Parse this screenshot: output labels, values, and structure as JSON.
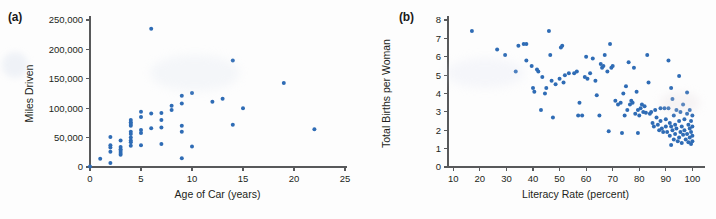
{
  "figure": {
    "background_color": "#fdfdfd",
    "marker_color": "#2f6cb5",
    "axis_color": "#58595b",
    "text_color": "#231f20"
  },
  "panels": [
    {
      "key": "a",
      "label": "(a)",
      "chart_data": {
        "type": "scatter",
        "title": "",
        "xlabel": "Age of Car (years)",
        "ylabel": "Miles Driven",
        "xlim": [
          0,
          25
        ],
        "ylim": [
          0,
          250000
        ],
        "xticks": [
          0,
          5,
          10,
          15,
          20,
          25
        ],
        "xticklabels": [
          "0",
          "5",
          "10",
          "15",
          "20",
          "25"
        ],
        "yticks": [
          0,
          50000,
          100000,
          150000,
          200000,
          250000
        ],
        "yticklabels": [
          "0",
          "50,000",
          "100,000",
          "150,000",
          "200,000",
          "250,000"
        ],
        "grid": false,
        "legend": "none",
        "series": [
          {
            "name": "Cars",
            "points": [
              [
                0,
                1000
              ],
              [
                1,
                14000
              ],
              [
                2,
                7000
              ],
              [
                2,
                26000
              ],
              [
                2,
                33000
              ],
              [
                2,
                37000
              ],
              [
                2,
                51000
              ],
              [
                3,
                21000
              ],
              [
                3,
                24000
              ],
              [
                3,
                27000
              ],
              [
                3,
                30000
              ],
              [
                3,
                34000
              ],
              [
                3,
                45000
              ],
              [
                4,
                36000
              ],
              [
                4,
                42000
              ],
              [
                4,
                45000
              ],
              [
                4,
                50000
              ],
              [
                4,
                56000
              ],
              [
                4,
                60000
              ],
              [
                4,
                70000
              ],
              [
                4,
                73000
              ],
              [
                4,
                76000
              ],
              [
                4,
                80000
              ],
              [
                5,
                37000
              ],
              [
                5,
                58000
              ],
              [
                5,
                63000
              ],
              [
                5,
                85000
              ],
              [
                5,
                94000
              ],
              [
                6,
                235000
              ],
              [
                6,
                66000
              ],
              [
                6,
                91000
              ],
              [
                7,
                39000
              ],
              [
                7,
                67000
              ],
              [
                7,
                80000
              ],
              [
                7,
                92000
              ],
              [
                8,
                97000
              ],
              [
                8,
                104000
              ],
              [
                9,
                15000
              ],
              [
                9,
                60000
              ],
              [
                9,
                70000
              ],
              [
                9,
                108000
              ],
              [
                9,
                121000
              ],
              [
                10,
                35000
              ],
              [
                10,
                126000
              ],
              [
                12,
                111000
              ],
              [
                13,
                116000
              ],
              [
                14,
                72000
              ],
              [
                14,
                181000
              ],
              [
                15,
                100000
              ],
              [
                19,
                143000
              ],
              [
                22,
                64000
              ]
            ]
          }
        ]
      }
    },
    {
      "key": "b",
      "label": "(b)",
      "chart_data": {
        "type": "scatter",
        "title": "",
        "xlabel": "Literacy Rate (percent)",
        "ylabel": "Total Births per Woman",
        "xlim": [
          8,
          104
        ],
        "ylim": [
          0,
          8
        ],
        "xticks": [
          10,
          20,
          30,
          40,
          50,
          60,
          70,
          80,
          90,
          100
        ],
        "xticklabels": [
          "10",
          "20",
          "30",
          "40",
          "50",
          "60",
          "70",
          "80",
          "90",
          "100"
        ],
        "yticks": [
          0,
          1,
          2,
          3,
          4,
          5,
          6,
          7,
          8
        ],
        "yticklabels": [
          "0",
          "1",
          "2",
          "3",
          "4",
          "5",
          "6",
          "7",
          "8"
        ],
        "grid": false,
        "legend": "none",
        "series": [
          {
            "name": "Countries",
            "points": [
              [
                17,
                7.4
              ],
              [
                26.5,
                6.4
              ],
              [
                29.5,
                6.1
              ],
              [
                33.5,
                5.2
              ],
              [
                34.5,
                6.6
              ],
              [
                36.5,
                6.7
              ],
              [
                37.5,
                6.7
              ],
              [
                37.5,
                5.8
              ],
              [
                39.5,
                5.5
              ],
              [
                40,
                4.3
              ],
              [
                40.5,
                4.1
              ],
              [
                41.5,
                5.3
              ],
              [
                42,
                5.2
              ],
              [
                43,
                3.1
              ],
              [
                43.5,
                4.9
              ],
              [
                44.5,
                4.0
              ],
              [
                45,
                4.3
              ],
              [
                46,
                7.4
              ],
              [
                46.5,
                6.1
              ],
              [
                47,
                4.7
              ],
              [
                47.5,
                2.7
              ],
              [
                48.5,
                4.5
              ],
              [
                50,
                4.8
              ],
              [
                50.5,
                6.5
              ],
              [
                51,
                6.6
              ],
              [
                51.5,
                4.6
              ],
              [
                52,
                5.0
              ],
              [
                53.5,
                5.1
              ],
              [
                55.5,
                5.1
              ],
              [
                56.5,
                5.2
              ],
              [
                57,
                2.8
              ],
              [
                57.5,
                3.5
              ],
              [
                58.5,
                2.8
              ],
              [
                59.5,
                4.9
              ],
              [
                60,
                6.0
              ],
              [
                60.5,
                4.8
              ],
              [
                61.5,
                5.1
              ],
              [
                62.5,
                5.9
              ],
              [
                63.5,
                4.7
              ],
              [
                64,
                3.9
              ],
              [
                65,
                2.8
              ],
              [
                65.5,
                5.6
              ],
              [
                66,
                5.4
              ],
              [
                66.5,
                5.5
              ],
              [
                67,
                6.1
              ],
              [
                68,
                5.2
              ],
              [
                68.5,
                1.95
              ],
              [
                69,
                6.7
              ],
              [
                69.5,
                5.4
              ],
              [
                70,
                5.5
              ],
              [
                71,
                3.6
              ],
              [
                72,
                3.4
              ],
              [
                73,
                3.5
              ],
              [
                73.5,
                1.85
              ],
              [
                74,
                4.0
              ],
              [
                74.5,
                2.8
              ],
              [
                75,
                4.4
              ],
              [
                75.5,
                3.1
              ],
              [
                76,
                5.7
              ],
              [
                76.5,
                3.4
              ],
              [
                77,
                3.6
              ],
              [
                77.5,
                3.5
              ],
              [
                78,
                5.4
              ],
              [
                78.5,
                2.9
              ],
              [
                79,
                4.1
              ],
              [
                79.5,
                3.1
              ],
              [
                79.5,
                1.85
              ],
              [
                80,
                2.8
              ],
              [
                80.5,
                3.2
              ],
              [
                81,
                3.4
              ],
              [
                81.5,
                3.0
              ],
              [
                82,
                3.3
              ],
              [
                82.5,
                2.95
              ],
              [
                83,
                6.1
              ],
              [
                83.5,
                4.6
              ],
              [
                84,
                2.9
              ],
              [
                84.5,
                3.0
              ],
              [
                85,
                2.4
              ],
              [
                85.5,
                2.2
              ],
              [
                86,
                3.1
              ],
              [
                86.5,
                2.7
              ],
              [
                87,
                2.3
              ],
              [
                87.5,
                2.0
              ],
              [
                88,
                3.2
              ],
              [
                88,
                2.5
              ],
              [
                88.5,
                2.1
              ],
              [
                89,
                1.9
              ],
              [
                89.5,
                3.2
              ],
              [
                90,
                2.6
              ],
              [
                90,
                2.2
              ],
              [
                90.5,
                1.9
              ],
              [
                91,
                5.8
              ],
              [
                91,
                3.2
              ],
              [
                91.5,
                2.4
              ],
              [
                91.5,
                1.7
              ],
              [
                92,
                4.3
              ],
              [
                92,
                2.2
              ],
              [
                92,
                1.2
              ],
              [
                92.5,
                3.7
              ],
              [
                92.5,
                2.0
              ],
              [
                93,
                2.8
              ],
              [
                93,
                1.5
              ],
              [
                93.5,
                2.3
              ],
              [
                93.5,
                1.8
              ],
              [
                94,
                3.1
              ],
              [
                94,
                2.1
              ],
              [
                94.5,
                1.4
              ],
              [
                95,
                4.95
              ],
              [
                95,
                2.5
              ],
              [
                95,
                1.6
              ],
              [
                95.5,
                3.0
              ],
              [
                95.5,
                1.9
              ],
              [
                96,
                2.2
              ],
              [
                96,
                1.3
              ],
              [
                96.5,
                3.4
              ],
              [
                96.5,
                1.75
              ],
              [
                97,
                2.6
              ],
              [
                97,
                2.0
              ],
              [
                97.5,
                1.5
              ],
              [
                98,
                4.05
              ],
              [
                98,
                2.9
              ],
              [
                98,
                1.8
              ],
              [
                98.5,
                2.3
              ],
              [
                98.5,
                1.35
              ],
              [
                99,
                3.1
              ],
              [
                99,
                2.1
              ],
              [
                99,
                1.6
              ],
              [
                99.5,
                2.5
              ],
              [
                99.5,
                1.9
              ],
              [
                99.5,
                1.25
              ],
              [
                100,
                2.8
              ],
              [
                100,
                2.2
              ],
              [
                100,
                1.7
              ],
              [
                100,
                1.4
              ]
            ]
          }
        ]
      }
    }
  ]
}
